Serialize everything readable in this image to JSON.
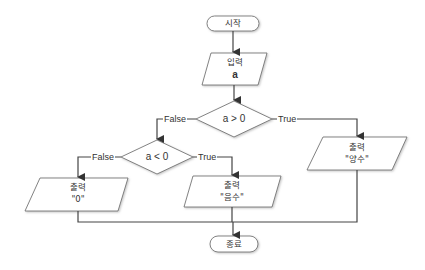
{
  "flowchart": {
    "start": {
      "label": "시작"
    },
    "input": {
      "label": "입력",
      "value": "a"
    },
    "decision1": {
      "label": "a > 0",
      "true_label": "True",
      "false_label": "False"
    },
    "decision2": {
      "label": "a < 0",
      "true_label": "True",
      "false_label": "False"
    },
    "output_zero": {
      "label": "출력",
      "value": "\"0\""
    },
    "output_negative": {
      "label": "출력",
      "value": "\"음수\""
    },
    "output_positive": {
      "label": "출력",
      "value": "\"양수\""
    },
    "end": {
      "label": "종료"
    },
    "colors": {
      "stroke": "#555555",
      "line": "#444444",
      "fill": "#ffffff"
    }
  }
}
